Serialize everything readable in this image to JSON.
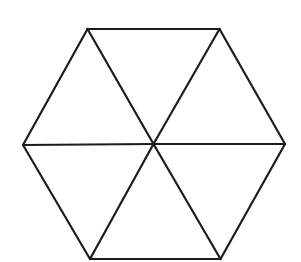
{
  "diagram": {
    "type": "hexagon-divided-into-triangles",
    "background": "#ffffff",
    "stroke_color": "#1c1c1c",
    "stroke_width": 2.2,
    "center": {
      "x": 153.5,
      "y": 144
    },
    "vertices": [
      {
        "name": "top-left",
        "x": 87.5,
        "y": 29
      },
      {
        "name": "top-right",
        "x": 219.5,
        "y": 29
      },
      {
        "name": "right",
        "x": 285,
        "y": 144
      },
      {
        "name": "bottom-right",
        "x": 220.5,
        "y": 259
      },
      {
        "name": "bottom-left",
        "x": 90,
        "y": 259
      },
      {
        "name": "left",
        "x": 23,
        "y": 145
      }
    ],
    "triangle_count": 6
  }
}
